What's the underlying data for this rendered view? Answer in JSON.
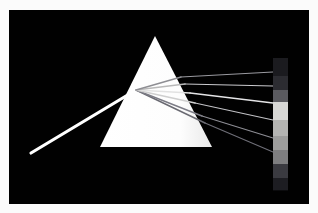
{
  "image": {
    "title": "Prism light dispersion",
    "description": "A narrow white light beam enters a triangular glass prism from the lower left and is refracted and dispersed into a fan of spectral rays that strike a vertical spectrum strip on the right, against a black background.",
    "border_color": "#fbfbfb",
    "background_color": "#010101",
    "width": 318,
    "height": 213
  },
  "prism": {
    "name": "triangular-prism",
    "fill_color": "#ffffff",
    "apex": {
      "x": 146,
      "y": 26
    },
    "base_left": {
      "x": 91,
      "y": 137
    },
    "base_right": {
      "x": 203,
      "y": 137
    },
    "shade_color": "#e8e8e8"
  },
  "incident_beam": {
    "name": "incident-white-beam",
    "color": "#ffffff",
    "start": {
      "x": 22,
      "y": 143
    },
    "end": {
      "x": 127,
      "y": 80
    },
    "width": 3.2
  },
  "entry_point": {
    "x": 127,
    "y": 80
  },
  "internal_rays": [
    {
      "name": "internal-ray-violet",
      "exit": {
        "x": 196,
        "y": 113
      },
      "color": "#6a6a72",
      "width": 1.5
    },
    {
      "name": "internal-ray-blue",
      "exit": {
        "x": 193,
        "y": 106
      },
      "color": "#7c7c86",
      "width": 1.4
    },
    {
      "name": "internal-ray-green",
      "exit": {
        "x": 186,
        "y": 93
      },
      "color": "#cfcfcf",
      "width": 1.6
    },
    {
      "name": "internal-ray-yellow",
      "exit": {
        "x": 181,
        "y": 83
      },
      "color": "#e2e2e2",
      "width": 1.5
    },
    {
      "name": "internal-ray-orange",
      "exit": {
        "x": 176,
        "y": 74
      },
      "color": "#b9b9b9",
      "width": 1.5
    },
    {
      "name": "internal-ray-red",
      "exit": {
        "x": 172,
        "y": 67
      },
      "color": "#8e8e93",
      "width": 1.4
    }
  ],
  "dispersed_rays": [
    {
      "name": "ray-red",
      "from": {
        "x": 172,
        "y": 67
      },
      "to": {
        "x": 264,
        "y": 62
      },
      "color": "#9a9aa0",
      "width": 1.2
    },
    {
      "name": "ray-orange",
      "from": {
        "x": 176,
        "y": 74
      },
      "to": {
        "x": 264,
        "y": 76
      },
      "color": "#c9c9cd",
      "width": 1.2
    },
    {
      "name": "ray-yellow",
      "from": {
        "x": 181,
        "y": 83
      },
      "to": {
        "x": 264,
        "y": 93
      },
      "color": "#e4e4e6",
      "width": 1.3
    },
    {
      "name": "ray-green",
      "from": {
        "x": 186,
        "y": 93
      },
      "to": {
        "x": 264,
        "y": 110
      },
      "color": "#c2c2c6",
      "width": 1.2
    },
    {
      "name": "ray-blue",
      "from": {
        "x": 193,
        "y": 106
      },
      "to": {
        "x": 264,
        "y": 128
      },
      "color": "#8d8d94",
      "width": 1.2
    },
    {
      "name": "ray-violet",
      "from": {
        "x": 196,
        "y": 113
      },
      "to": {
        "x": 264,
        "y": 142
      },
      "color": "#6f6f78",
      "width": 1.1
    }
  ],
  "spectrum_strip": {
    "name": "spectrum-strip",
    "x": 264,
    "y": 48,
    "width": 15,
    "height": 132,
    "bands": [
      {
        "name": "band-infrared",
        "color": "#1b1b1f",
        "height": 18
      },
      {
        "name": "band-red",
        "color": "#2c2c31",
        "height": 14
      },
      {
        "name": "band-orange",
        "color": "#5a5a5f",
        "height": 12
      },
      {
        "name": "band-yellow",
        "color": "#d6d6d4",
        "height": 18
      },
      {
        "name": "band-green",
        "color": "#b4b4b2",
        "height": 16
      },
      {
        "name": "band-cyan",
        "color": "#9d9d9c",
        "height": 14
      },
      {
        "name": "band-blue",
        "color": "#7e7e80",
        "height": 14
      },
      {
        "name": "band-violet",
        "color": "#3a3a40",
        "height": 14
      },
      {
        "name": "band-ultraviolet",
        "color": "#1d1d22",
        "height": 12
      }
    ]
  }
}
